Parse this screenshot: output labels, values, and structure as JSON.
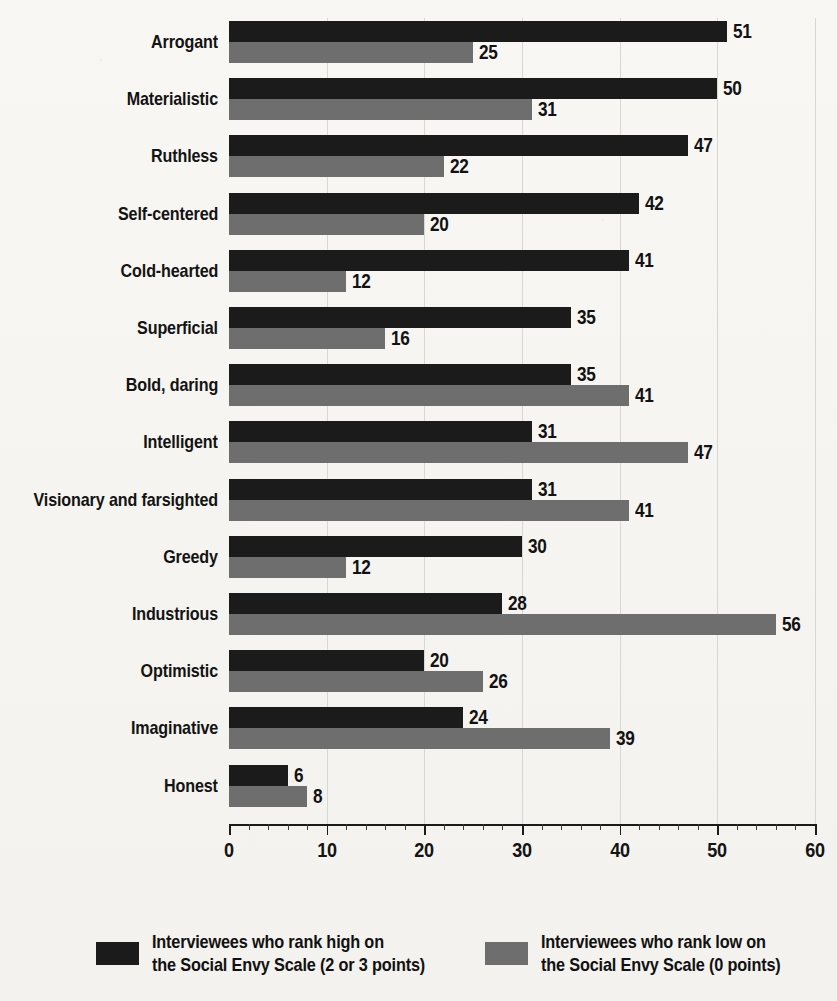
{
  "chart_data": {
    "type": "bar",
    "orientation": "horizontal",
    "title": "",
    "subtitle": "",
    "xlabel": "",
    "ylabel": "",
    "xlim": [
      0,
      60
    ],
    "xticks": [
      0,
      10,
      20,
      30,
      40,
      50,
      60
    ],
    "xtick_labels": [
      "0",
      "10",
      "20",
      "30",
      "40",
      "50",
      "60"
    ],
    "minor_tick_step": 2,
    "grid": "vertical-major",
    "legend_position": "bottom",
    "categories": [
      "Arrogant",
      "Materialistic",
      "Ruthless",
      "Self-centered",
      "Cold-hearted",
      "Superficial",
      "Bold, daring",
      "Intelligent",
      "Visionary and farsighted",
      "Greedy",
      "Industrious",
      "Optimistic",
      "Imaginative",
      "Honest"
    ],
    "series": [
      {
        "name": "Interviewees who rank high on the Social Envy Scale (2 or 3 points)",
        "color": "#1b1b1b",
        "values": [
          51,
          50,
          47,
          42,
          41,
          35,
          35,
          31,
          31,
          30,
          28,
          20,
          24,
          6
        ]
      },
      {
        "name": "Interviewees who rank low on the Social Envy Scale (0 points)",
        "color": "#6e6e6e",
        "values": [
          25,
          31,
          22,
          20,
          12,
          16,
          41,
          47,
          41,
          12,
          56,
          26,
          39,
          8
        ]
      }
    ]
  },
  "legend": {
    "items": [
      {
        "swatch": "high",
        "line1": "Interviewees who rank high on",
        "line2": "the Social Envy Scale (2 or 3 points)"
      },
      {
        "swatch": "low",
        "line1": "Interviewees who rank low on",
        "line2": "the Social Envy Scale (0 points)"
      }
    ]
  }
}
